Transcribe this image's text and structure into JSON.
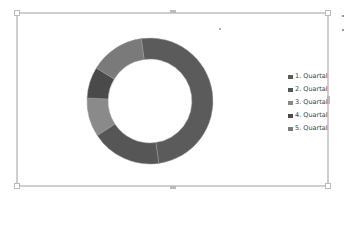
{
  "chart_data": {
    "type": "pie",
    "subtype": "doughnut",
    "title": "",
    "categories": [
      "1. Quartal",
      "2. Quartal",
      "3. Quartal",
      "4. Quartal",
      "5. Quartal"
    ],
    "values": [
      50,
      18,
      10,
      8,
      14
    ],
    "colors": [
      "#5b5b5b",
      "#565656",
      "#8a8a8a",
      "#4a4a4a",
      "#7a7a7a"
    ],
    "start_angle_deg": -8,
    "legend_position": "right"
  },
  "legend": {
    "items": [
      {
        "label": "1. Quartal",
        "color": "#5b5b5b"
      },
      {
        "label": "2. Quartal",
        "color": "#565656"
      },
      {
        "label": "3. Quartal",
        "color": "#8a8a8a"
      },
      {
        "label": "4. Quartal",
        "color": "#4a4a4a"
      },
      {
        "label": "5. Quartal",
        "color": "#7a7a7a"
      }
    ]
  }
}
